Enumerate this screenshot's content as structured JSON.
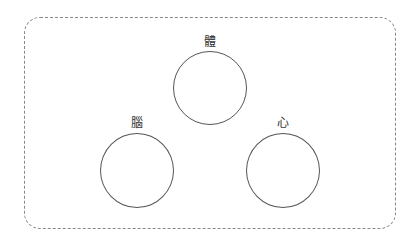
{
  "diagram": {
    "nodes": [
      {
        "id": "body",
        "label": "體"
      },
      {
        "id": "brain",
        "label": "腦"
      },
      {
        "id": "heart",
        "label": "心"
      }
    ]
  },
  "colors": {
    "circle_stroke": "#555555",
    "frame_stroke": "#888888"
  }
}
